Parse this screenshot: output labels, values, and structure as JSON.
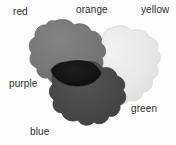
{
  "figure": {
    "background_color": "#fdfdfd",
    "width": 176,
    "height": 145
  },
  "labels": [
    {
      "id": "red",
      "text": "red"
    },
    {
      "id": "orange",
      "text": "orange"
    },
    {
      "id": "yellow",
      "text": "yellow"
    },
    {
      "id": "purple",
      "text": "purple"
    },
    {
      "id": "green",
      "text": "green"
    },
    {
      "id": "blue",
      "text": "blue"
    }
  ],
  "blobs": [
    {
      "id": "upper-left-blob",
      "related_labels": [
        "red",
        "orange"
      ],
      "fill": "#767676",
      "edge": "#6a6a6a"
    },
    {
      "id": "right-blob",
      "related_labels": [
        "yellow",
        "green"
      ],
      "fill": "#e6e6e6",
      "edge": "#d2d2d2"
    },
    {
      "id": "lower-blob",
      "related_labels": [
        "purple",
        "blue"
      ],
      "fill": "#474747",
      "edge": "#3d3d3d"
    },
    {
      "id": "overlap-region",
      "related_labels": [
        "purple"
      ],
      "fill": "#141414",
      "edge": "#0d0d0d"
    }
  ],
  "palette": {
    "text_color": "#2b2b2b",
    "background": "#fdfdfd",
    "light_gray": "#e6e6e6",
    "mid_gray": "#767676",
    "dark_gray": "#474747",
    "near_black": "#141414"
  }
}
